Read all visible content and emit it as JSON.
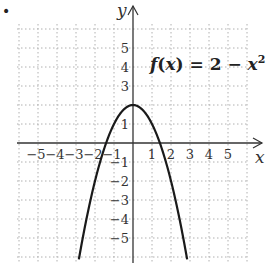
{
  "chart_data": {
    "type": "line",
    "title": "",
    "function_label": "f(x) = 2 − x²",
    "function_parts": {
      "f": "f",
      "open": "(",
      "x": "x",
      "close": ")",
      "eq": " = 2 − ",
      "x2": "x",
      "exp": "2"
    },
    "xlabel": "x",
    "ylabel": "y",
    "xlim": [
      -6,
      6
    ],
    "ylim": [
      -6,
      6
    ],
    "grid": true,
    "grid_style": "dotted",
    "x_ticks": [
      -5,
      -4,
      -3,
      -2,
      -1,
      1,
      2,
      3,
      4,
      5
    ],
    "y_ticks": [
      -5,
      -4,
      -3,
      -2,
      -1,
      1,
      3,
      4,
      5
    ],
    "x_tick_labels": [
      "−5",
      "−4",
      "−3",
      "−2",
      "−1",
      "1",
      "2",
      "3",
      "4",
      "5"
    ],
    "y_tick_labels": [
      "5",
      "4",
      "3",
      "1",
      "−1",
      "−2",
      "−3",
      "−4",
      "−5"
    ],
    "series": [
      {
        "name": "f(x) = 2 − x²",
        "x": [
          -2.8,
          -2.5,
          -2,
          -1.5,
          -1,
          -0.5,
          0,
          0.5,
          1,
          1.5,
          2,
          2.5,
          2.8
        ],
        "y": [
          -5.84,
          -4.25,
          -2,
          -0.25,
          1,
          1.75,
          2,
          1.75,
          1,
          -0.25,
          -2,
          -4.25,
          -5.84
        ]
      }
    ],
    "vertex": [
      0,
      2
    ],
    "line_color": "#1a1a1a",
    "grid_color": "#b0b0b0"
  },
  "bullet": "•"
}
